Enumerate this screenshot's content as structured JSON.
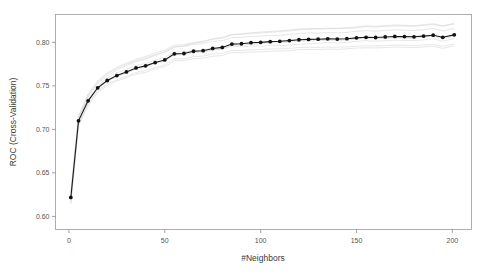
{
  "chart_data": {
    "type": "line",
    "title": "",
    "xlabel": "#Neighbors",
    "ylabel": "ROC (Cross-Validation)",
    "xlim": [
      -7,
      210
    ],
    "ylim": [
      0.585,
      0.832
    ],
    "xticks": [
      0,
      50,
      100,
      150,
      200
    ],
    "xtick_labels": [
      "0",
      "50",
      "100",
      "150",
      "200"
    ],
    "yticks": [
      0.6,
      0.65,
      0.7,
      0.75,
      0.8
    ],
    "ytick_labels": [
      "0.60",
      "0.65",
      "0.70",
      "0.75",
      "0.80"
    ],
    "grid": false,
    "legend": "none",
    "x": [
      1,
      5,
      10,
      15,
      20,
      25,
      30,
      35,
      40,
      45,
      50,
      55,
      60,
      65,
      70,
      75,
      80,
      85,
      90,
      95,
      100,
      105,
      110,
      115,
      120,
      125,
      130,
      135,
      140,
      145,
      150,
      155,
      160,
      165,
      170,
      175,
      180,
      185,
      190,
      195,
      201
    ],
    "series": [
      {
        "name": "ROC (mean resampled)",
        "marker": "filled-circle",
        "color": "#111111",
        "values": [
          0.6218,
          0.7098,
          0.7328,
          0.7478,
          0.7562,
          0.7618,
          0.766,
          0.7706,
          0.773,
          0.7768,
          0.7798,
          0.7868,
          0.7872,
          0.7898,
          0.7904,
          0.793,
          0.7942,
          0.798,
          0.7984,
          0.7996,
          0.8,
          0.8008,
          0.8012,
          0.802,
          0.803,
          0.8034,
          0.8036,
          0.804,
          0.8038,
          0.8042,
          0.8052,
          0.8058,
          0.8056,
          0.8062,
          0.8068,
          0.8066,
          0.8064,
          0.8072,
          0.8082,
          0.8058,
          0.8086
        ]
      },
      {
        "name": "resample 1",
        "color": "#cfcfcf",
        "values": [
          0.619,
          0.7108,
          0.7372,
          0.7528,
          0.7618,
          0.7682,
          0.7734,
          0.7776,
          0.7808,
          0.785,
          0.7886,
          0.7942,
          0.796,
          0.799,
          0.8004,
          0.8036,
          0.8046,
          0.8086,
          0.8092,
          0.81,
          0.8108,
          0.8116,
          0.8122,
          0.8132,
          0.8144,
          0.815,
          0.8152,
          0.8156,
          0.8158,
          0.816,
          0.8168,
          0.818,
          0.8176,
          0.8182,
          0.819,
          0.8186,
          0.8184,
          0.8194,
          0.8204,
          0.8186,
          0.821
        ]
      },
      {
        "name": "resample 2",
        "color": "#cfcfcf",
        "values": [
          0.624,
          0.712,
          0.7348,
          0.7498,
          0.759,
          0.765,
          0.769,
          0.7736,
          0.7756,
          0.7796,
          0.7826,
          0.7886,
          0.789,
          0.7908,
          0.79,
          0.7916,
          0.7922,
          0.7956,
          0.7948,
          0.7956,
          0.7958,
          0.7966,
          0.7962,
          0.7968,
          0.7978,
          0.7982,
          0.799,
          0.7996,
          0.7992,
          0.8,
          0.8012,
          0.802,
          0.8014,
          0.8018,
          0.8026,
          0.8022,
          0.802,
          0.8028,
          0.804,
          0.8014,
          0.8044
        ]
      },
      {
        "name": "resample 3",
        "color": "#cfcfcf",
        "values": [
          0.616,
          0.706,
          0.7296,
          0.7442,
          0.7524,
          0.7572,
          0.7612,
          0.7654,
          0.7678,
          0.7712,
          0.7742,
          0.781,
          0.7812,
          0.7836,
          0.7842,
          0.7866,
          0.7874,
          0.7908,
          0.7906,
          0.7916,
          0.7918,
          0.7924,
          0.7926,
          0.7932,
          0.794,
          0.7944,
          0.7942,
          0.7946,
          0.7944,
          0.7948,
          0.7956,
          0.796,
          0.7958,
          0.7962,
          0.7968,
          0.7966,
          0.7962,
          0.797,
          0.7978,
          0.7954,
          0.7982
        ]
      },
      {
        "name": "resample 4",
        "color": "#cfcfcf",
        "values": [
          0.6262,
          0.714,
          0.7392,
          0.7544,
          0.7636,
          0.77,
          0.7748,
          0.779,
          0.782,
          0.786,
          0.7892,
          0.7952,
          0.7954,
          0.7976,
          0.7986,
          0.8012,
          0.802,
          0.8054,
          0.8058,
          0.8068,
          0.8072,
          0.8078,
          0.8082,
          0.809,
          0.8102,
          0.8108,
          0.8106,
          0.8112,
          0.8108,
          0.8114,
          0.8126,
          0.8134,
          0.8128,
          0.8136,
          0.8144,
          0.814,
          0.8136,
          0.8146,
          0.8158,
          0.813,
          0.8162
        ]
      },
      {
        "name": "resample 5",
        "color": "#cfcfcf",
        "values": [
          0.6142,
          0.7042,
          0.7272,
          0.7424,
          0.7504,
          0.7556,
          0.7592,
          0.7636,
          0.7656,
          0.7692,
          0.772,
          0.7788,
          0.7792,
          0.7812,
          0.7818,
          0.784,
          0.785,
          0.7884,
          0.788,
          0.789,
          0.7892,
          0.7898,
          0.79,
          0.7906,
          0.7916,
          0.792,
          0.7918,
          0.7922,
          0.792,
          0.7926,
          0.7934,
          0.7938,
          0.7936,
          0.794,
          0.7946,
          0.7944,
          0.794,
          0.7948,
          0.7956,
          0.7932,
          0.796
        ]
      },
      {
        "name": "resample 6",
        "color": "#cfcfcf",
        "values": [
          0.6208,
          0.7086,
          0.7318,
          0.7466,
          0.7552,
          0.7606,
          0.7648,
          0.7694,
          0.7718,
          0.7756,
          0.7786,
          0.7854,
          0.7858,
          0.7882,
          0.7888,
          0.7912,
          0.7926,
          0.7962,
          0.7968,
          0.7978,
          0.7984,
          0.7992,
          0.7996,
          0.8004,
          0.8014,
          0.8018,
          0.802,
          0.8024,
          0.8022,
          0.8028,
          0.8038,
          0.8044,
          0.804,
          0.8046,
          0.8052,
          0.805,
          0.8046,
          0.8056,
          0.8066,
          0.8042,
          0.807
        ]
      },
      {
        "name": "resample 7",
        "color": "#cfcfcf",
        "values": [
          0.628,
          0.7152,
          0.7404,
          0.7556,
          0.765,
          0.7714,
          0.7762,
          0.7806,
          0.7838,
          0.7878,
          0.791,
          0.7968,
          0.7974,
          0.7998,
          0.8012,
          0.8042,
          0.8056,
          0.8092,
          0.8098,
          0.811,
          0.8118,
          0.8126,
          0.8132,
          0.8142,
          0.8154,
          0.816,
          0.8158,
          0.8164,
          0.8162,
          0.8168,
          0.8178,
          0.819,
          0.8184,
          0.8192,
          0.82,
          0.8196,
          0.8192,
          0.8202,
          0.8214,
          0.819,
          0.822
        ]
      }
    ]
  },
  "axes": {
    "x_title": "#Neighbors",
    "y_title": "ROC (Cross-Validation)"
  }
}
